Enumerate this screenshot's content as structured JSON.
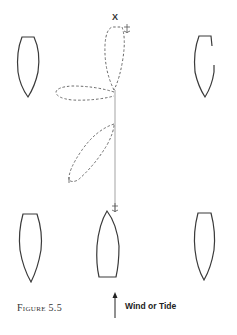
{
  "figure": {
    "caption": "Figure 5.5",
    "marker_label": "X",
    "legend": {
      "icon": "arrow-up-icon",
      "label": "Wind or Tide"
    },
    "elements": {
      "boats": [
        {
          "id": "boat-top-left",
          "position": "top-left"
        },
        {
          "id": "boat-top-right",
          "position": "top-right"
        },
        {
          "id": "boat-bottom-left",
          "position": "bottom-left"
        },
        {
          "id": "boat-bottom-center",
          "position": "bottom-center",
          "anchored": true
        },
        {
          "id": "boat-bottom-right",
          "position": "bottom-right"
        }
      ],
      "swing_paths": [
        {
          "id": "swing-path-up",
          "style": "dashed"
        },
        {
          "id": "swing-path-left",
          "style": "dashed"
        },
        {
          "id": "swing-path-lower-left",
          "style": "dashed"
        }
      ],
      "anchor_line": {
        "style": "solid",
        "color": "#b0b0b0"
      },
      "anchors": [
        "anchor-top",
        "anchor-bottom"
      ]
    },
    "colors": {
      "outline": "#3a3a3a",
      "dashed": "#6a6a6a",
      "line": "#b8b8b8"
    }
  }
}
